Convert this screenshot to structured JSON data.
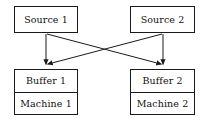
{
  "diagram": {
    "background_color": "#ffffff",
    "line_color": "#1a1a1a",
    "text_color": "#111111",
    "nodes": [
      {
        "id": "source1",
        "label": "Source 1",
        "x": 14,
        "y": 6,
        "width": 64,
        "height": 27
      },
      {
        "id": "source2",
        "label": "Source 2",
        "x": 130,
        "y": 6,
        "width": 65,
        "height": 27
      },
      {
        "id": "station1",
        "buffer_label": "Buffer 1",
        "machine_label": "Machine 1",
        "x": 14,
        "y": 69,
        "width": 64,
        "height": 46
      },
      {
        "id": "station2",
        "buffer_label": "Buffer 2",
        "machine_label": "Machine 2",
        "x": 130,
        "y": 69,
        "width": 65,
        "height": 46
      }
    ],
    "edges": [
      {
        "id": "s1-b1",
        "from": "source1",
        "to": "station1",
        "type": "straight-down"
      },
      {
        "id": "s2-b2",
        "from": "source2",
        "to": "station2",
        "type": "straight-down"
      },
      {
        "id": "s1-b2",
        "from": "source1",
        "to": "station2",
        "type": "diagonal-cross"
      },
      {
        "id": "s2-b1",
        "from": "source2",
        "to": "station1",
        "type": "diagonal-cross"
      }
    ],
    "crossing_point": {
      "x": 105,
      "y": 51
    }
  }
}
